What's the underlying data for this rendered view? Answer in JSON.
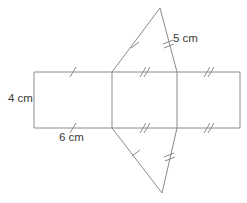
{
  "figure": {
    "stroke_color": "#8a8a8a",
    "tick_color": "#8a8a8a",
    "label_color": "#3a3a3a",
    "background_color": "#ffffff",
    "labels": [
      {
        "id": "height-label",
        "text": "4 cm",
        "x": 8,
        "y": 99
      },
      {
        "id": "base-label",
        "text": "6 cm",
        "x": 59,
        "y": 138
      },
      {
        "id": "slant-label",
        "text": "5 cm",
        "x": 173,
        "y": 39
      }
    ],
    "rectangle": {
      "left": 34,
      "right": 240,
      "top": 72,
      "bottom": 128,
      "divider_x": [
        112,
        177
      ]
    },
    "top_triangle": {
      "apex_x": 160,
      "apex_y": 8,
      "left_x": 112,
      "right_x": 177,
      "base_y": 72
    },
    "bottom_triangle": {
      "apex_x": 162,
      "apex_y": 193,
      "left_x": 112,
      "right_x": 177,
      "base_y": 128
    },
    "tick_marks": {
      "single_label": "single tick",
      "double_label": "double tick"
    }
  }
}
